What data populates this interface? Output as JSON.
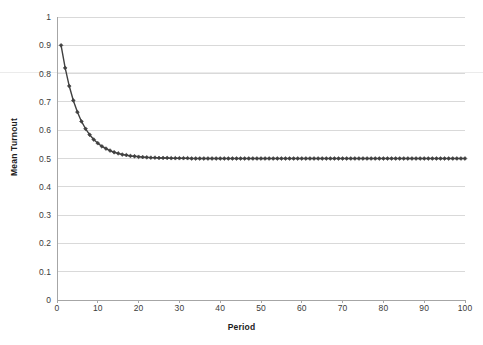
{
  "chart_data": {
    "type": "line",
    "title": "",
    "xlabel": "Period",
    "ylabel": "Mean Turnout",
    "xlim": [
      0,
      100
    ],
    "ylim": [
      0,
      1
    ],
    "grid": "horizontal",
    "legend": "none",
    "marker": "diamond",
    "series_color": "#404040",
    "gridline_color": "#d9d9d9",
    "axis_color": "#a6a6a6",
    "xticks": [
      0,
      10,
      20,
      30,
      40,
      50,
      60,
      70,
      80,
      90,
      100
    ],
    "xtick_labels": [
      "0",
      "10",
      "20",
      "30",
      "40",
      "50",
      "60",
      "70",
      "80",
      "90",
      "100"
    ],
    "yticks": [
      0,
      0.1,
      0.2,
      0.3,
      0.4,
      0.5,
      0.6,
      0.7,
      0.8,
      0.9,
      1
    ],
    "ytick_labels": [
      "0",
      "0.1",
      "0.2",
      "0.3",
      "0.4",
      "0.5",
      "0.6",
      "0.7",
      "0.8",
      "0.9",
      "1"
    ],
    "series": [
      {
        "name": "Mean Turnout",
        "x": [
          1,
          2,
          3,
          4,
          5,
          6,
          7,
          8,
          9,
          10,
          11,
          12,
          13,
          14,
          15,
          16,
          17,
          18,
          19,
          20,
          21,
          22,
          23,
          24,
          25,
          26,
          27,
          28,
          29,
          30,
          31,
          32,
          33,
          34,
          35,
          36,
          37,
          38,
          39,
          40,
          41,
          42,
          43,
          44,
          45,
          46,
          47,
          48,
          49,
          50,
          51,
          52,
          53,
          54,
          55,
          56,
          57,
          58,
          59,
          60,
          61,
          62,
          63,
          64,
          65,
          66,
          67,
          68,
          69,
          70,
          71,
          72,
          73,
          74,
          75,
          76,
          77,
          78,
          79,
          80,
          81,
          82,
          83,
          84,
          85,
          86,
          87,
          88,
          89,
          90,
          91,
          92,
          93,
          94,
          95,
          96,
          97,
          98,
          99,
          100
        ],
        "values": [
          0.9,
          0.82,
          0.756,
          0.705,
          0.664,
          0.631,
          0.605,
          0.584,
          0.567,
          0.554,
          0.543,
          0.535,
          0.528,
          0.522,
          0.518,
          0.514,
          0.512,
          0.509,
          0.508,
          0.506,
          0.505,
          0.504,
          0.503,
          0.503,
          0.502,
          0.502,
          0.502,
          0.501,
          0.501,
          0.501,
          0.501,
          0.501,
          0.5,
          0.5,
          0.5,
          0.5,
          0.5,
          0.5,
          0.5,
          0.5,
          0.5,
          0.5,
          0.5,
          0.5,
          0.5,
          0.5,
          0.5,
          0.5,
          0.5,
          0.5,
          0.5,
          0.5,
          0.5,
          0.5,
          0.5,
          0.5,
          0.5,
          0.5,
          0.5,
          0.5,
          0.5,
          0.5,
          0.5,
          0.5,
          0.5,
          0.5,
          0.5,
          0.5,
          0.5,
          0.5,
          0.5,
          0.5,
          0.5,
          0.5,
          0.5,
          0.5,
          0.5,
          0.5,
          0.5,
          0.5,
          0.5,
          0.5,
          0.5,
          0.5,
          0.5,
          0.5,
          0.5,
          0.5,
          0.5,
          0.5,
          0.5,
          0.5,
          0.5,
          0.5,
          0.5,
          0.5,
          0.5,
          0.5,
          0.5,
          0.5
        ]
      }
    ]
  }
}
